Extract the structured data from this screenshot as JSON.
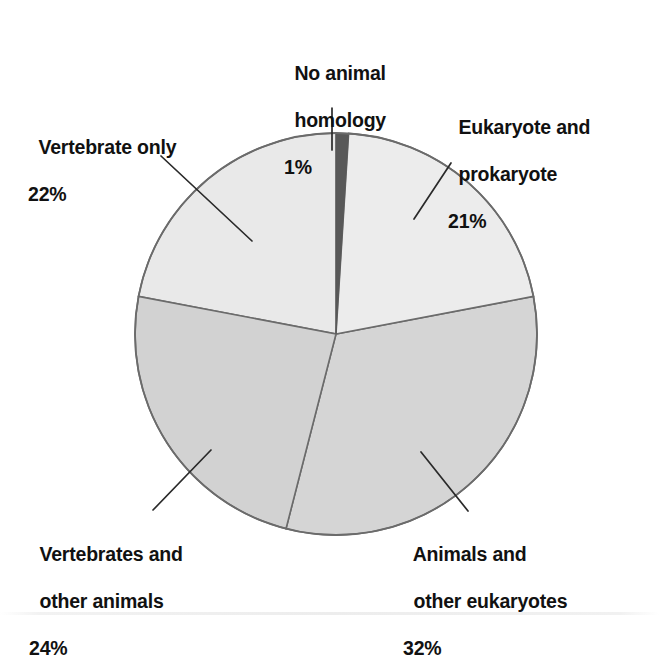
{
  "chart_data": {
    "type": "pie",
    "title": "",
    "subtitle": "",
    "xlabel": "",
    "ylabel": "",
    "legend_position": "none",
    "grid": false,
    "units": "%",
    "start_angle_deg": 0,
    "direction": "clockwise",
    "categories": [
      "No animal homology",
      "Eukaryote and prokaryote",
      "Animals and other eukaryotes",
      "Vertebrates and other animals",
      "Vertebrate only"
    ],
    "values": [
      1,
      21,
      32,
      24,
      22
    ],
    "slices": [
      {
        "id": "no-animal-homology",
        "label_line1": "No animal",
        "label_line2": "homology",
        "percent_text": "1%",
        "value": 1,
        "color": "#585858",
        "start_deg": 0,
        "end_deg": 3.6
      },
      {
        "id": "eukaryote-and-prokaryote",
        "label_line1": "Eukaryote and",
        "label_line2": "prokaryote",
        "percent_text": "21%",
        "value": 21,
        "color": "#ececec",
        "start_deg": 3.6,
        "end_deg": 79.2
      },
      {
        "id": "animals-and-other-eukaryotes",
        "label_line1": "Animals and",
        "label_line2": "other eukaryotes",
        "percent_text": "32%",
        "value": 32,
        "color": "#d5d5d5",
        "start_deg": 79.2,
        "end_deg": 194.4
      },
      {
        "id": "vertebrates-and-other-animals",
        "label_line1": "Vertebrates and",
        "label_line2": "other animals",
        "percent_text": "24%",
        "value": 24,
        "color": "#d2d2d2",
        "start_deg": 194.4,
        "end_deg": 280.8
      },
      {
        "id": "vertebrate-only",
        "label_line1": "Vertebrate only",
        "label_line2": "",
        "percent_text": "22%",
        "value": 22,
        "color": "#e9e9e9",
        "start_deg": 280.8,
        "end_deg": 360
      }
    ],
    "geometry": {
      "center_x": 336,
      "center_y": 334,
      "radius": 201
    },
    "colors": {
      "outline": "#6b6b6b",
      "leader_line": "#2a2a2a",
      "text": "#111111",
      "background": "#ffffff"
    }
  }
}
